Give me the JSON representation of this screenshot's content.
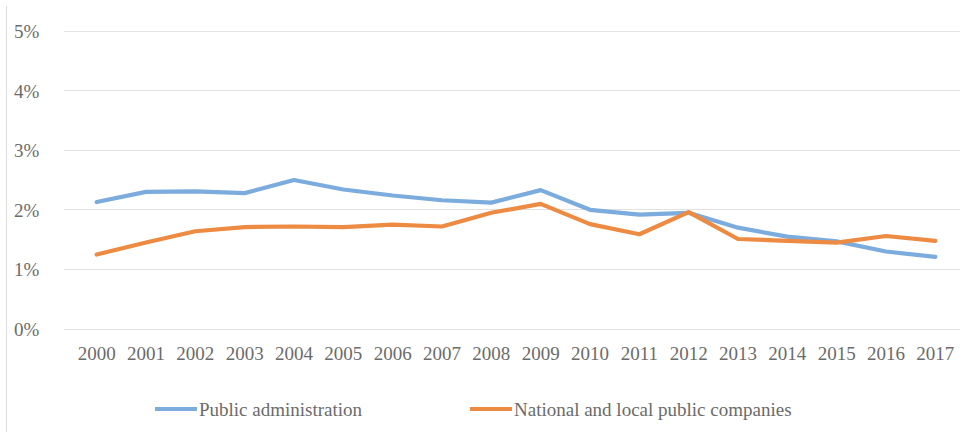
{
  "chart_data": {
    "type": "line",
    "title": "",
    "subtitle": "",
    "xlabel": "",
    "ylabel": "",
    "categories": [
      "2000",
      "2001",
      "2002",
      "2003",
      "2004",
      "2005",
      "2006",
      "2007",
      "2008",
      "2009",
      "2010",
      "2011",
      "2012",
      "2013",
      "2014",
      "2015",
      "2016",
      "2017"
    ],
    "ytick_labels": [
      "0%",
      "1%",
      "2%",
      "3%",
      "4%",
      "5%"
    ],
    "ytick_values": [
      0,
      1,
      2,
      3,
      4,
      5
    ],
    "ylim": [
      0,
      5
    ],
    "grid": true,
    "legend_position": "bottom",
    "series": [
      {
        "name": "Public administration",
        "color": "#7CABDD",
        "values": [
          2.13,
          2.3,
          2.31,
          2.28,
          2.5,
          2.34,
          2.24,
          2.16,
          2.12,
          2.33,
          2.0,
          1.92,
          1.95,
          1.7,
          1.55,
          1.47,
          1.3,
          1.21
        ]
      },
      {
        "name": "National and local public companies",
        "color": "#ED8B43",
        "values": [
          1.25,
          1.45,
          1.64,
          1.71,
          1.72,
          1.71,
          1.75,
          1.72,
          1.95,
          2.1,
          1.76,
          1.59,
          1.96,
          1.51,
          1.48,
          1.45,
          1.56,
          1.48
        ]
      }
    ]
  },
  "legend": {
    "items": [
      {
        "label": "Public administration",
        "color": "#7CABDD"
      },
      {
        "label": "National and local public companies",
        "color": "#ED8B43"
      }
    ]
  },
  "colors": {
    "series_blue": "#7CABDD",
    "series_orange": "#ED8B43",
    "gridline": "#e2e2e2",
    "text": "#6b6b6b",
    "background": "#ffffff"
  }
}
